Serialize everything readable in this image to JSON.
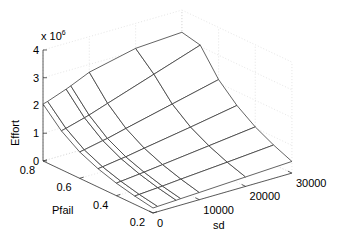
{
  "chart_data": {
    "type": "surface",
    "title": "",
    "xlabel": "sd",
    "ylabel": "Pfail",
    "zlabel": "Effort",
    "z_exponent_label": "x 10",
    "z_exponent": "6",
    "x_ticks": [
      0,
      10000,
      20000,
      30000
    ],
    "x_tick_labels": [
      "0",
      "10000",
      "20000",
      "30000"
    ],
    "y_ticks": [
      0.2,
      0.4,
      0.6,
      0.8
    ],
    "y_tick_labels": [
      "0.2",
      "0.4",
      "0.6",
      "0.8"
    ],
    "z_ticks": [
      0,
      1,
      2,
      3,
      4
    ],
    "z_tick_labels": [
      "0",
      "1",
      "2",
      "3",
      "4"
    ],
    "xlim": [
      0,
      30000
    ],
    "ylim": [
      0.2,
      0.8
    ],
    "zlim": [
      0,
      4
    ],
    "grid": true,
    "x": [
      0,
      1000,
      5000,
      6000,
      10000,
      20000,
      30000
    ],
    "y": [
      0.2,
      0.3,
      0.4,
      0.5,
      0.6,
      0.7,
      0.8
    ],
    "z_units": "x 10^6",
    "z": [
      [
        0.18,
        0.19,
        0.22,
        0.23,
        0.26,
        0.34,
        0.42
      ],
      [
        0.3,
        0.31,
        0.36,
        0.37,
        0.43,
        0.56,
        0.7
      ],
      [
        0.45,
        0.47,
        0.54,
        0.56,
        0.64,
        0.84,
        1.04
      ],
      [
        0.66,
        0.68,
        0.78,
        0.8,
        0.92,
        1.2,
        1.5
      ],
      [
        0.95,
        0.98,
        1.12,
        1.15,
        1.32,
        1.72,
        2.12
      ],
      [
        1.4,
        1.44,
        1.63,
        1.68,
        1.91,
        2.48,
        3.05
      ],
      [
        2.05,
        2.1,
        2.35,
        2.42,
        2.72,
        3.1,
        3.2
      ]
    ]
  },
  "projection": {
    "origin_px": [
      153,
      213
    ],
    "sd_unit_px": [
      4.63,
      -1.33
    ],
    "pfail_unit_px": [
      -183.3,
      -86.7
    ],
    "z_unit_px": [
      0,
      -27.75
    ]
  }
}
